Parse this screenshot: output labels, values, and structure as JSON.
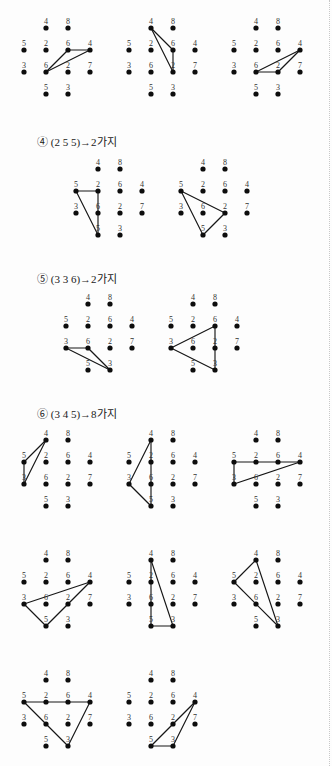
{
  "page": {
    "width": 332,
    "height": 766,
    "background": "#fdfdfd",
    "dot_color": "#0d0d0d",
    "edge_color": "#161616",
    "label_color": "#333333"
  },
  "grid": {
    "description": "4-column by 4-row dot lattice; row1 and row4 only have columns 2 and 3",
    "col_spacing": 22,
    "row_spacing": 22,
    "dot_radius": 2.6,
    "cells": [
      {
        "row": 1,
        "col": 2,
        "label": "4"
      },
      {
        "row": 1,
        "col": 3,
        "label": "8"
      },
      {
        "row": 2,
        "col": 1,
        "label": "5"
      },
      {
        "row": 2,
        "col": 2,
        "label": "2"
      },
      {
        "row": 2,
        "col": 3,
        "label": "6"
      },
      {
        "row": 2,
        "col": 4,
        "label": "4"
      },
      {
        "row": 3,
        "col": 1,
        "label": "3"
      },
      {
        "row": 3,
        "col": 2,
        "label": "6"
      },
      {
        "row": 3,
        "col": 3,
        "label": "2"
      },
      {
        "row": 3,
        "col": 4,
        "label": "7"
      },
      {
        "row": 4,
        "col": 2,
        "label": "5"
      },
      {
        "row": 4,
        "col": 3,
        "label": "3"
      }
    ]
  },
  "sections": [
    {
      "id": "section-3-continued",
      "label": null,
      "x": 0,
      "y": 14,
      "figures": [
        {
          "name": "figure-row0-1",
          "x": 14,
          "y": 16,
          "edges": [
            [
              2,
              3,
              2,
              4
            ],
            [
              2,
              3,
              3,
              2
            ],
            [
              2,
              4,
              3,
              2
            ]
          ]
        },
        {
          "name": "figure-row0-2",
          "x": 119,
          "y": 16,
          "edges": [
            [
              1,
              2,
              2,
              3
            ],
            [
              1,
              2,
              3,
              3
            ],
            [
              2,
              3,
              3,
              3
            ]
          ]
        },
        {
          "name": "figure-row0-3",
          "x": 224,
          "y": 16,
          "edges": [
            [
              3,
              2,
              3,
              3
            ],
            [
              3,
              3,
              2,
              4
            ],
            [
              3,
              2,
              2,
              4
            ]
          ]
        }
      ]
    },
    {
      "id": "section-4",
      "label": "④ (2 5 5)→2가지",
      "x": 37,
      "y": 133,
      "figures": [
        {
          "name": "figure-s4-1",
          "x": 66,
          "y": 157,
          "edges": [
            [
              2,
              1,
              2,
              2
            ],
            [
              2,
              2,
              4,
              2
            ],
            [
              2,
              1,
              4,
              2
            ]
          ]
        },
        {
          "name": "figure-s4-2",
          "x": 171,
          "y": 157,
          "edges": [
            [
              2,
              1,
              3,
              3
            ],
            [
              3,
              3,
              4,
              2
            ],
            [
              2,
              1,
              4,
              2
            ]
          ]
        }
      ]
    },
    {
      "id": "section-5",
      "label": "⑤ (3 3 6)→2가지",
      "x": 37,
      "y": 270,
      "figures": [
        {
          "name": "figure-s5-1",
          "x": 56,
          "y": 292,
          "edges": [
            [
              3,
              1,
              3,
              2
            ],
            [
              3,
              2,
              4,
              3
            ],
            [
              3,
              1,
              4,
              3
            ]
          ]
        },
        {
          "name": "figure-s5-2",
          "x": 161,
          "y": 292,
          "edges": [
            [
              3,
              1,
              2,
              3
            ],
            [
              2,
              3,
              4,
              3
            ],
            [
              3,
              1,
              4,
              3
            ]
          ]
        }
      ]
    },
    {
      "id": "section-6",
      "label": "⑥ (3 4 5)→8가지",
      "x": 37,
      "y": 405,
      "figures": [
        {
          "name": "figure-s6-1",
          "x": 14,
          "y": 428,
          "edges": [
            [
              2,
              1,
              1,
              2
            ],
            [
              1,
              2,
              3,
              1
            ],
            [
              2,
              1,
              3,
              1
            ]
          ]
        },
        {
          "name": "figure-s6-2",
          "x": 119,
          "y": 428,
          "edges": [
            [
              1,
              2,
              3,
              1
            ],
            [
              1,
              2,
              4,
              2
            ],
            [
              3,
              1,
              4,
              2
            ]
          ]
        },
        {
          "name": "figure-s6-3",
          "x": 224,
          "y": 428,
          "edges": [
            [
              2,
              1,
              2,
              4
            ],
            [
              2,
              4,
              3,
              1
            ],
            [
              2,
              1,
              3,
              1
            ]
          ]
        },
        {
          "name": "figure-s6-4",
          "x": 14,
          "y": 548,
          "edges": [
            [
              3,
              1,
              2,
              4
            ],
            [
              2,
              4,
              4,
              2
            ],
            [
              3,
              1,
              4,
              2
            ]
          ]
        },
        {
          "name": "figure-s6-5",
          "x": 119,
          "y": 548,
          "edges": [
            [
              1,
              2,
              4,
              2
            ],
            [
              1,
              2,
              4,
              3
            ],
            [
              4,
              2,
              4,
              3
            ]
          ]
        },
        {
          "name": "figure-s6-6",
          "x": 224,
          "y": 548,
          "edges": [
            [
              2,
              1,
              1,
              2
            ],
            [
              1,
              2,
              4,
              3
            ],
            [
              2,
              1,
              4,
              3
            ]
          ]
        },
        {
          "name": "figure-s6-7",
          "x": 14,
          "y": 668,
          "edges": [
            [
              2,
              1,
              2,
              4
            ],
            [
              2,
              4,
              4,
              3
            ],
            [
              2,
              1,
              4,
              3
            ]
          ]
        },
        {
          "name": "figure-s6-8",
          "x": 119,
          "y": 668,
          "edges": [
            [
              2,
              4,
              3,
              3
            ],
            [
              3,
              3,
              4,
              2
            ],
            [
              4,
              2,
              4,
              3
            ],
            [
              2,
              4,
              4,
              3
            ]
          ]
        }
      ]
    }
  ]
}
